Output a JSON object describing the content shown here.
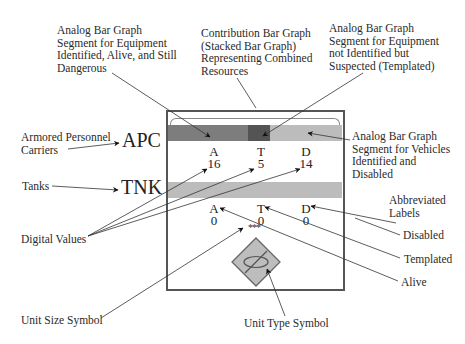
{
  "callouts": {
    "alive_segment": [
      "Analog Bar Graph",
      "Segment for Equipment",
      "Identified, Alive, and Still",
      "Dangerous"
    ],
    "contribution": [
      "Contribution Bar Graph",
      "(Stacked Bar Graph)",
      "Representing Combined",
      "Resources"
    ],
    "templated_segment": [
      "Analog Bar Graph",
      "Segment for Equipment",
      "not Identified but",
      "Suspected (Templated)"
    ],
    "disabled_segment": [
      "Analog Bar Graph",
      "Segment for Vehicles",
      "Identified and",
      "Disabled"
    ],
    "apc_label": [
      "Armored Personnel",
      "Carriers"
    ],
    "tanks_label": "Tanks",
    "digital_values": "Digital Values",
    "abbreviated_labels": [
      "Abbreviated",
      "Labels"
    ],
    "disabled": "Disabled",
    "templated": "Templated",
    "alive": "Alive",
    "unit_size": "Unit Size Symbol",
    "unit_type": "Unit Type Symbol"
  },
  "panel": {
    "rows": [
      {
        "abbr": "APC",
        "segments": [
          {
            "name": "alive",
            "color": "#7d7d7d"
          },
          {
            "name": "templated",
            "color": "#545454"
          },
          {
            "name": "disabled",
            "color": "#bcbcbc"
          }
        ],
        "labels": {
          "A": "A",
          "T": "T",
          "D": "D"
        },
        "values": {
          "A": "16",
          "T": "5",
          "D": "14"
        }
      },
      {
        "abbr": "TNK",
        "segments": [
          {
            "name": "disabled",
            "color": "#bcbcbc"
          }
        ],
        "labels": {
          "A": "A",
          "T": "T",
          "D": "D"
        },
        "values": {
          "A": "0",
          "T": "0",
          "D": "0"
        }
      }
    ],
    "unit_size_symbol": "***",
    "unit_type_fill": "#bdbdbd",
    "border_color": "#555555"
  }
}
